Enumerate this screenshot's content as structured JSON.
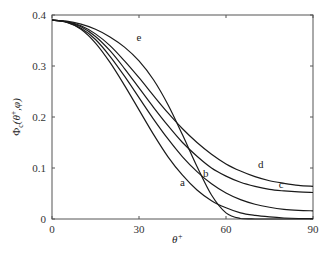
{
  "chart_data": {
    "type": "line",
    "title": "",
    "xlabel": "θ+",
    "ylabel": "Φc(θ+, φ)",
    "xlim": [
      0,
      90
    ],
    "ylim": [
      0,
      0.4
    ],
    "xticks": [
      "0",
      "30",
      "60",
      "90"
    ],
    "yticks": [
      "0",
      "0.1",
      "0.2",
      "0.3",
      "0.4"
    ],
    "grid": false,
    "legend": "inline curve labels",
    "x": [
      0,
      5,
      10,
      15,
      20,
      25,
      30,
      35,
      40,
      45,
      50,
      55,
      60,
      65,
      70,
      75,
      80,
      85,
      90
    ],
    "series": [
      {
        "name": "a",
        "values": [
          0.39,
          0.386,
          0.372,
          0.345,
          0.307,
          0.262,
          0.214,
          0.166,
          0.122,
          0.086,
          0.057,
          0.036,
          0.022,
          0.012,
          0.007,
          0.004,
          0.002,
          0.001,
          0.001
        ]
      },
      {
        "name": "b",
        "values": [
          0.39,
          0.386,
          0.374,
          0.352,
          0.319,
          0.28,
          0.238,
          0.196,
          0.157,
          0.122,
          0.093,
          0.069,
          0.051,
          0.038,
          0.029,
          0.023,
          0.019,
          0.017,
          0.016
        ]
      },
      {
        "name": "c",
        "values": [
          0.39,
          0.387,
          0.377,
          0.358,
          0.33,
          0.295,
          0.257,
          0.219,
          0.183,
          0.15,
          0.123,
          0.1,
          0.084,
          0.072,
          0.064,
          0.058,
          0.055,
          0.053,
          0.052
        ]
      },
      {
        "name": "d",
        "values": [
          0.39,
          0.387,
          0.379,
          0.363,
          0.34,
          0.31,
          0.277,
          0.242,
          0.208,
          0.177,
          0.15,
          0.127,
          0.108,
          0.094,
          0.083,
          0.075,
          0.07,
          0.066,
          0.064
        ]
      },
      {
        "name": "e",
        "values": [
          0.39,
          0.388,
          0.382,
          0.372,
          0.357,
          0.337,
          0.31,
          0.273,
          0.224,
          0.165,
          0.103,
          0.047,
          0.012,
          0.001,
          0.0,
          0.0,
          0.0,
          0.0,
          0.0
        ]
      }
    ],
    "annotations": [
      {
        "text": "e",
        "x": 30,
        "y": 0.35
      },
      {
        "text": "d",
        "x": 72,
        "y": 0.1
      },
      {
        "text": "c",
        "x": 79,
        "y": 0.06
      },
      {
        "text": "b",
        "x": 53,
        "y": 0.082
      },
      {
        "text": "a",
        "x": 45,
        "y": 0.064
      }
    ]
  }
}
